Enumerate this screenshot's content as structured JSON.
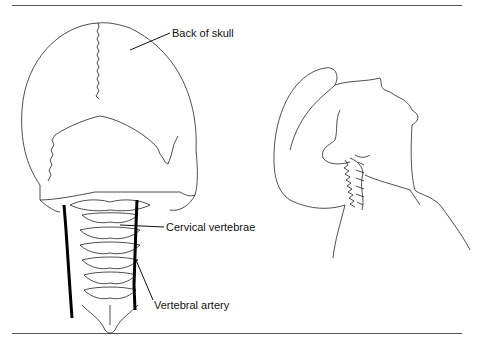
{
  "figure": {
    "labels": {
      "back_of_skull": "Back of skull",
      "cervical_vertebrae": "Cervical vertebrae",
      "vertebral_artery": "Vertebral artery"
    },
    "panels": [
      {
        "name": "posterior-view",
        "description": "Back of skull and cervical spine with vertebral arteries"
      },
      {
        "name": "lateral-view",
        "description": "Head tilted back showing neck extension and cervical spine"
      }
    ],
    "colors": {
      "line": "#222222",
      "artery": "#000000",
      "background": "#ffffff"
    }
  }
}
